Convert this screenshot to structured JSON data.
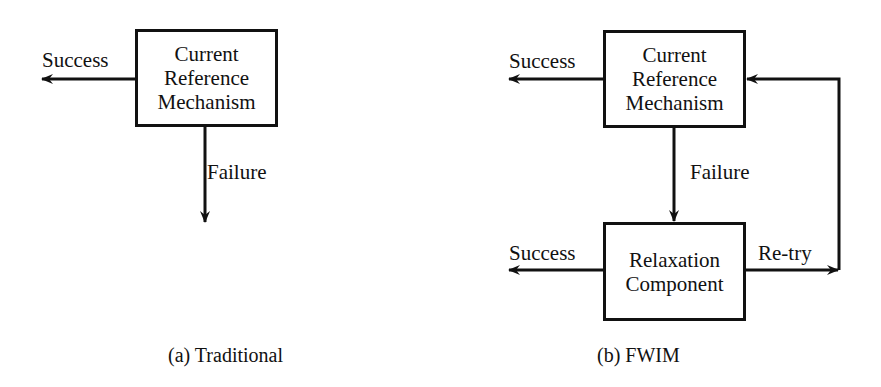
{
  "panels": [
    {
      "id": "a",
      "caption": "(a) Traditional",
      "box": {
        "lines": [
          "Current",
          "Reference",
          "Mechanism"
        ]
      },
      "success_label": "Success",
      "failure_label": "Failure"
    },
    {
      "id": "b",
      "caption": "(b) FWIM",
      "top_box": {
        "lines": [
          "Current",
          "Reference",
          "Mechanism"
        ]
      },
      "bottom_box": {
        "lines": [
          "Relaxation",
          "Component"
        ]
      },
      "top_success_label": "Success",
      "failure_label": "Failure",
      "bottom_success_label": "Success",
      "retry_label": "Re-try"
    }
  ]
}
